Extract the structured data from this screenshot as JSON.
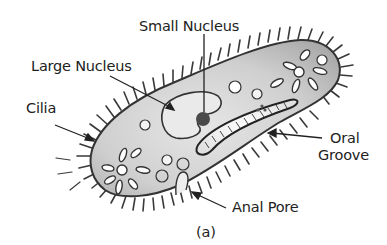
{
  "figure": {
    "caption": "(a)",
    "colors": {
      "cytoplasm": "#c8c8c8",
      "outline": "#333333",
      "text": "#222222",
      "nucleus_dark": "#444444"
    }
  },
  "labels": {
    "small_nucleus": "Small Nucleus",
    "large_nucleus": "Large Nucleus",
    "cilia": "Cilia",
    "oral_groove_line1": "Oral",
    "oral_groove_line2": "Groove",
    "anal_pore": "Anal Pore"
  }
}
